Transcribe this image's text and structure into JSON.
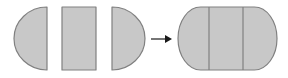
{
  "diagram": {
    "background_color": "#ffffff",
    "fill_color": "#c8c8c8",
    "stroke_color": "#808080",
    "stroke_width": 1.2,
    "arrow_color": "#1a1a1a",
    "canvas": {
      "width": 288,
      "height": 78
    },
    "relation": "equals",
    "pieces": [
      {
        "id": "piece-left-halfdisc",
        "label": "left half disc",
        "shape": "half-disc",
        "orientation": "curve-left",
        "x": 14,
        "y": 7,
        "width": 33,
        "height": 63
      },
      {
        "id": "piece-rectangle",
        "label": "rectangle",
        "shape": "rectangle",
        "orientation": "upright",
        "x": 62,
        "y": 7,
        "width": 34,
        "height": 63
      },
      {
        "id": "piece-right-halfdisc",
        "label": "right half disc",
        "shape": "half-disc",
        "orientation": "curve-right",
        "x": 112,
        "y": 7,
        "width": 33,
        "height": 63
      }
    ],
    "arrow": {
      "id": "transform-arrow",
      "label": "becomes",
      "glyph": "→",
      "x1": 151,
      "x2": 172,
      "y": 39,
      "head_length": 7,
      "head_half_width": 4
    },
    "result": {
      "id": "result-stadium",
      "label": "stadium",
      "shape": "stadium",
      "x": 178,
      "y": 7,
      "width": 99,
      "height": 63,
      "dividers": [
        209,
        243
      ],
      "divider_labels": [
        "seam left",
        "seam right"
      ]
    }
  }
}
